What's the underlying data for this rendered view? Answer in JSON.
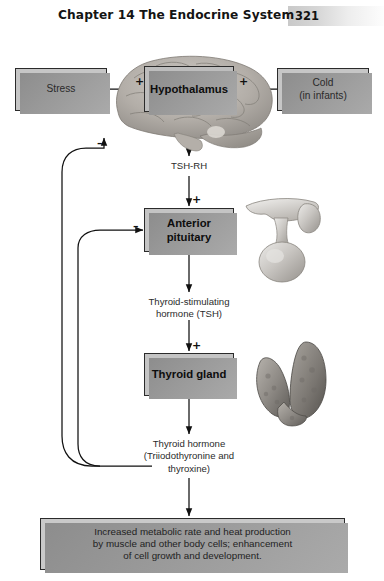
{
  "header": {
    "chapter_title": "Chapter 14  The Endocrine System",
    "page_number": "321"
  },
  "diagram": {
    "boxes": {
      "stress": "Stress",
      "cold": "Cold\n(in infants)",
      "cold_line1": "Cold",
      "cold_line2": "(in infants)",
      "hypothalamus": "Hypothalamus",
      "anterior_pituitary_line1": "Anterior",
      "anterior_pituitary_line2": "pituitary",
      "thyroid_gland": "Thyroid gland",
      "effects_line1": "Increased metabolic rate and heat  production",
      "effects_line2": "by muscle and other  body cells; enhancement",
      "effects_line3": "of cell growth and development."
    },
    "flow_labels": {
      "tsh_rh": "TSH-RH",
      "tsh_line1": "Thyroid-stimulating",
      "tsh_line2": "hormone (TSH)",
      "thyroid_hormone_line1": "Thyroid hormone",
      "thyroid_hormone_line2": "(Triiodothyronine and",
      "thyroid_hormone_line3": "thyroxine)"
    },
    "signs": {
      "plus_stress": "+",
      "plus_cold": "+",
      "minus_to_hypothalamus": "–",
      "plus_to_pituitary": "+",
      "minus_to_pituitary": "–",
      "plus_to_thyroid": "+"
    },
    "organs": {
      "brain": "brain-illustration",
      "pituitary": "pituitary-gland-illustration",
      "thyroid": "thyroid-gland-illustration"
    },
    "colors": {
      "box_fill": "#c9c9c9",
      "box_border": "#2b2b2b",
      "box_shadow": "#8d8d8d",
      "line": "#1a1a1a",
      "page_band_start": "#c9c9c9",
      "page_band_end": "#fdfdfd"
    }
  }
}
